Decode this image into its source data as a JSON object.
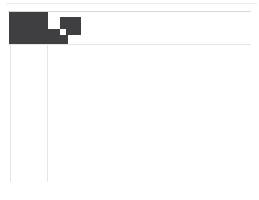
{
  "page": {
    "background_color": "#ffffff",
    "width": 259,
    "height": 200
  },
  "rules": {
    "top_outer_color": "#ececee",
    "header_top_color": "#d8d8da",
    "header_bottom_color": "#e4e4e6",
    "column_color": "#e6e6e8"
  },
  "blocks": {
    "fill_color": "#3f3f41",
    "primary_label": "",
    "connector_label": "",
    "secondary_label": ""
  },
  "caption": {
    "text": ""
  }
}
